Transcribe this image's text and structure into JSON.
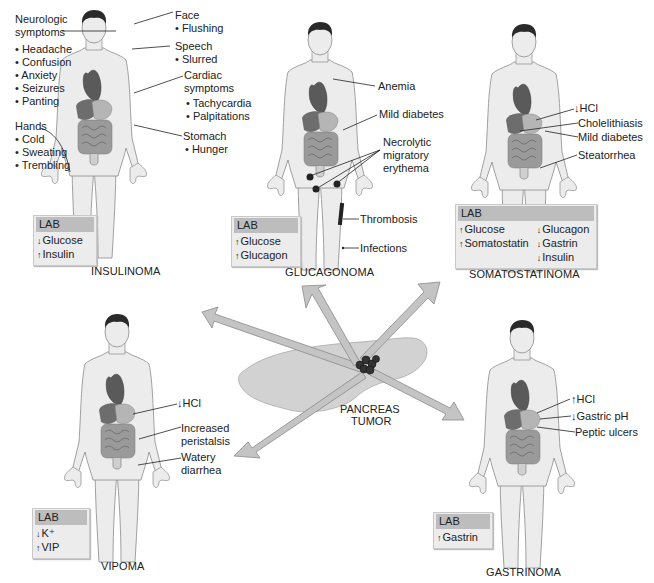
{
  "figure": {
    "colors": {
      "skin": "#ececec",
      "outline": "#8a8a8a",
      "hair": "#2a2a2a",
      "heart": "#5a5a5a",
      "liver": "#6d6d6d",
      "stomach": "#b5b5b5",
      "intestine": "#9a9a9a",
      "arrow": "#c4c4c4",
      "pancreas": "#d2d2d2",
      "lab_bg": "#ececec",
      "lab_header": "#bdbdbd"
    },
    "center": {
      "label_line1": "PANCREAS",
      "label_line2": "TUMOR"
    },
    "panels": {
      "insulinoma": {
        "title": "INSULINOMA",
        "labels": {
          "neuro_heading1": "Neurologic",
          "neuro_heading2": "symptoms",
          "neuro_items": [
            "• Headache",
            "• Confusion",
            "• Anxiety",
            "• Seizures",
            "• Panting"
          ],
          "hands_heading": "Hands",
          "hands_items": [
            "• Cold",
            "• Sweating",
            "• Trembling"
          ],
          "face_heading": "Face",
          "face_items": [
            "• Flushing"
          ],
          "speech_heading": "Speech",
          "speech_items": [
            "• Slurred"
          ],
          "cardiac_heading1": "Cardiac",
          "cardiac_heading2": "symptoms",
          "cardiac_items": [
            "• Tachycardia",
            "• Palpitations"
          ],
          "stomach_heading": "Stomach",
          "stomach_items": [
            "• Hunger"
          ]
        },
        "lab": {
          "header": "LAB",
          "rows": [
            {
              "dir": "↓",
              "text": "Glucose"
            },
            {
              "dir": "↑",
              "text": "Insulin"
            }
          ]
        }
      },
      "glucagonoma": {
        "title": "GLUCAGONOMA",
        "labels": {
          "anemia": "Anemia",
          "mild_diabetes": "Mild diabetes",
          "nme1": "Necrolytic",
          "nme2": "migratory",
          "nme3": "erythema",
          "thrombosis": "Thrombosis",
          "infections": "Infections"
        },
        "lab": {
          "header": "LAB",
          "rows": [
            {
              "dir": "↑",
              "text": "Glucose"
            },
            {
              "dir": "↑",
              "text": "Glucagon"
            }
          ]
        }
      },
      "somatostatinoma": {
        "title": "SOMATOSTATINOMA",
        "labels": {
          "hcl": "↓HCl",
          "cholelithiasis": "Cholelithiasis",
          "mild_diabetes": "Mild diabetes",
          "steatorrhea": "Steatorrhea"
        },
        "lab": {
          "header": "LAB",
          "col1": [
            {
              "dir": "↑",
              "text": "Glucose"
            },
            {
              "dir": "↑",
              "text": "Somatostatin"
            }
          ],
          "col2": [
            {
              "dir": "↓",
              "text": "Glucagon"
            },
            {
              "dir": "↓",
              "text": "Gastrin"
            },
            {
              "dir": "↓",
              "text": "Insulin"
            }
          ]
        }
      },
      "vipoma": {
        "title": "VIPOMA",
        "labels": {
          "hcl": "↓HCl",
          "peristalsis1": "Increased",
          "peristalsis2": "peristalsis",
          "diarrhea1": "Watery",
          "diarrhea2": "diarrhea"
        },
        "lab": {
          "header": "LAB",
          "rows": [
            {
              "dir": "↓",
              "text": "K⁺"
            },
            {
              "dir": "↑",
              "text": "VIP"
            }
          ]
        }
      },
      "gastrinoma": {
        "title": "GASTRINOMA",
        "labels": {
          "hcl": "↑HCl",
          "gastric_ph": "↓Gastric pH",
          "peptic_ulcers": "Peptic ulcers"
        },
        "lab": {
          "header": "LAB",
          "rows": [
            {
              "dir": "↑",
              "text": "Gastrin"
            }
          ]
        }
      }
    }
  }
}
